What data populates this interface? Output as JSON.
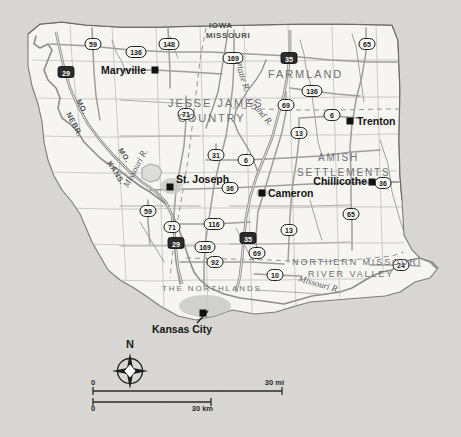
{
  "map": {
    "background_color": "#d9d8d4",
    "land_color": "#f6f5f2",
    "road_color": "#9a9a9a",
    "border_color": "#6a6a6a",
    "water_color": "#8a8a8a",
    "cities": [
      {
        "name": "Maryville",
        "label_x": 146,
        "label_y": 74,
        "anchor": "end",
        "dot_x": 155,
        "dot_y": 70
      },
      {
        "name": "Trenton",
        "label_x": 357,
        "label_y": 125,
        "anchor": "start",
        "dot_x": 350,
        "dot_y": 121
      },
      {
        "name": "St. Joseph",
        "label_x": 176,
        "label_y": 183,
        "anchor": "start",
        "dot_x": 170,
        "dot_y": 187
      },
      {
        "name": "Cameron",
        "label_x": 268,
        "label_y": 197,
        "anchor": "start",
        "dot_x": 262,
        "dot_y": 193
      },
      {
        "name": "Chillicothe",
        "label_x": 367,
        "label_y": 185,
        "anchor": "end",
        "dot_x": 372,
        "dot_y": 182
      },
      {
        "name": "Kansas City",
        "label_x": 152,
        "label_y": 333,
        "anchor": "start",
        "dot_x": 203,
        "dot_y": 313
      }
    ],
    "regions": [
      {
        "name": "JESSE JAMES",
        "x": 168,
        "y": 107,
        "size": 11
      },
      {
        "name": "COUNTRY",
        "x": 178,
        "y": 122,
        "size": 11
      },
      {
        "name": "FARMLAND",
        "x": 268,
        "y": 78,
        "size": 11
      },
      {
        "name": "AMISH",
        "x": 318,
        "y": 161,
        "size": 10
      },
      {
        "name": "SETTLEMENTS",
        "x": 297,
        "y": 176,
        "size": 10
      },
      {
        "name": "NORTHERN MISSOURI",
        "x": 292,
        "y": 265,
        "size": 9
      },
      {
        "name": "RIVER VALLEY",
        "x": 308,
        "y": 277,
        "size": 9
      },
      {
        "name": "THE NORTHLANDS",
        "x": 162,
        "y": 291,
        "size": 8
      }
    ],
    "states": [
      {
        "name": "IOWA",
        "x": 209,
        "y": 28
      },
      {
        "name": "MISSOURI",
        "x": 206,
        "y": 38
      }
    ],
    "border_labels": [
      {
        "name": "MO.",
        "x": 76,
        "y": 101,
        "rotate": 62
      },
      {
        "name": "NEBR.",
        "x": 66,
        "y": 114,
        "rotate": 62
      },
      {
        "name": "MO.",
        "x": 118,
        "y": 150,
        "rotate": 58
      },
      {
        "name": "KANS.",
        "x": 107,
        "y": 163,
        "rotate": 58
      }
    ],
    "rivers": [
      {
        "name": "Platte R.",
        "x": 235,
        "y": 62,
        "rotate": 72,
        "size": 9
      },
      {
        "name": "Grand R.",
        "x": 247,
        "y": 101,
        "rotate": 48,
        "size": 9
      },
      {
        "name": "Missouri R.",
        "x": 128,
        "y": 188,
        "rotate": -62,
        "size": 9
      },
      {
        "name": "Missouri R.",
        "x": 298,
        "y": 281,
        "rotate": 16,
        "size": 9
      }
    ],
    "shields": [
      {
        "route": "59",
        "type": "us",
        "x": 93,
        "y": 44
      },
      {
        "route": "136",
        "type": "us",
        "x": 136,
        "y": 52
      },
      {
        "route": "148",
        "type": "state",
        "x": 169,
        "y": 44
      },
      {
        "route": "29",
        "type": "interstate",
        "x": 66,
        "y": 72
      },
      {
        "route": "169",
        "type": "us",
        "x": 233,
        "y": 58
      },
      {
        "route": "35",
        "type": "interstate",
        "x": 289,
        "y": 58
      },
      {
        "route": "65",
        "type": "us",
        "x": 367,
        "y": 44
      },
      {
        "route": "136",
        "type": "us",
        "x": 312,
        "y": 91
      },
      {
        "route": "71",
        "type": "us",
        "x": 186,
        "y": 114
      },
      {
        "route": "69",
        "type": "us",
        "x": 286,
        "y": 105
      },
      {
        "route": "6",
        "type": "state",
        "x": 332,
        "y": 115
      },
      {
        "route": "31",
        "type": "state",
        "x": 216,
        "y": 155
      },
      {
        "route": "6",
        "type": "state",
        "x": 246,
        "y": 160
      },
      {
        "route": "13",
        "type": "state",
        "x": 299,
        "y": 133
      },
      {
        "route": "36",
        "type": "us",
        "x": 230,
        "y": 188
      },
      {
        "route": "36",
        "type": "us",
        "x": 383,
        "y": 183
      },
      {
        "route": "59",
        "type": "us",
        "x": 148,
        "y": 211
      },
      {
        "route": "71",
        "type": "us",
        "x": 172,
        "y": 227
      },
      {
        "route": "116",
        "type": "state",
        "x": 214,
        "y": 224
      },
      {
        "route": "29",
        "type": "interstate",
        "x": 176,
        "y": 243
      },
      {
        "route": "169",
        "type": "us",
        "x": 205,
        "y": 247
      },
      {
        "route": "35",
        "type": "interstate",
        "x": 248,
        "y": 238
      },
      {
        "route": "13",
        "type": "state",
        "x": 289,
        "y": 230
      },
      {
        "route": "65",
        "type": "us",
        "x": 351,
        "y": 214
      },
      {
        "route": "92",
        "type": "state",
        "x": 215,
        "y": 262
      },
      {
        "route": "69",
        "type": "us",
        "x": 257,
        "y": 253
      },
      {
        "route": "10",
        "type": "state",
        "x": 275,
        "y": 275
      },
      {
        "route": "24",
        "type": "us",
        "x": 401,
        "y": 265
      }
    ],
    "compass": {
      "label": "N",
      "x": 130,
      "y": 348
    },
    "scale": {
      "miles_zero": "0",
      "miles_label": "30 mi",
      "km_zero": "0",
      "km_label": "30 km",
      "miles_bar_px": 189,
      "km_bar_px": 118
    }
  }
}
